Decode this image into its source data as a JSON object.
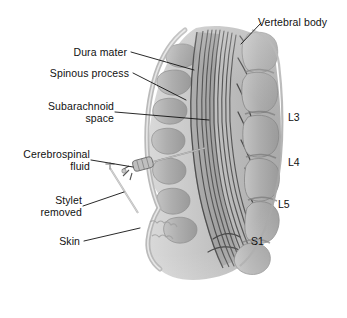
{
  "figure": {
    "background_color": "#ffffff",
    "line_color": "#111111",
    "bone_color": "#b0b0b0",
    "bone_shadow_color": "#8a8a8a",
    "fiber_color": "#5a5a5a",
    "skin_color": "#c9c9c9",
    "needle_color": "#9a9a9a"
  },
  "labels": {
    "vertebral_body": "Vertebral body",
    "dura_mater": "Dura mater",
    "spinous_process": "Spinous process",
    "subarachnoid_space_line1": "Subarachnoid",
    "subarachnoid_space_line2": "space",
    "cerebrospinal_fluid_line1": "Cerebrospinal",
    "cerebrospinal_fluid_line2": "fluid",
    "stylet_removed_line1": "Stylet",
    "stylet_removed_line2": "removed",
    "skin": "Skin"
  },
  "vertebral_levels": {
    "l3": "L3",
    "l4": "L4",
    "l5": "L5",
    "s1": "S1"
  }
}
